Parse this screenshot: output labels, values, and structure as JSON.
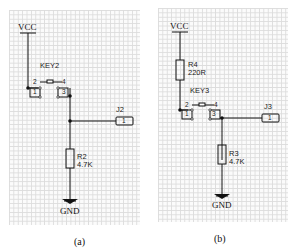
{
  "figure": {
    "panels": [
      {
        "id": "a",
        "caption": "(a)",
        "power_label": "VCC",
        "ground_label": "GND",
        "switch": {
          "ref": "KEY2",
          "pins": [
            "2",
            "4",
            "1",
            "3"
          ]
        },
        "connector": {
          "ref": "J2",
          "pin": "1"
        },
        "resistor_pulldown": {
          "ref": "R2",
          "value": "4.7K"
        }
      },
      {
        "id": "b",
        "caption": "(b)",
        "power_label": "VCC",
        "ground_label": "GND",
        "resistor_series": {
          "ref": "R4",
          "value": "220R"
        },
        "switch": {
          "ref": "KEY3",
          "pins": [
            "2",
            "4",
            "1",
            "3"
          ]
        },
        "connector": {
          "ref": "J3",
          "pin": "1"
        },
        "resistor_pulldown": {
          "ref": "R3",
          "value": "4.7K"
        }
      }
    ],
    "colors": {
      "wire": "#111111",
      "grid": "#dcdcdc",
      "background": "#fbfbfb"
    }
  }
}
